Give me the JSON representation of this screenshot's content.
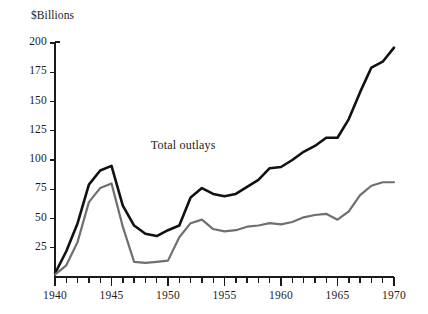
{
  "chart_data": {
    "type": "line",
    "title": "",
    "subtitle": "",
    "xlabel": "",
    "ylabel": "$Billions",
    "unit_label": "$Billions",
    "xlim": [
      1940,
      1970
    ],
    "ylim": [
      0,
      200
    ],
    "grid": false,
    "legend_position": "inline-annotation",
    "x_tick_interval": 1,
    "x_label_interval": 5,
    "y_tick_interval": 25,
    "y_ticks": [
      25,
      50,
      75,
      100,
      125,
      150,
      175,
      200
    ],
    "y_tick_labels": [
      "25",
      "50",
      "75",
      "100",
      "125",
      "150",
      "175",
      "200"
    ],
    "x_ticks": [
      1940,
      1941,
      1942,
      1943,
      1944,
      1945,
      1946,
      1947,
      1948,
      1949,
      1950,
      1951,
      1952,
      1953,
      1954,
      1955,
      1956,
      1957,
      1958,
      1959,
      1960,
      1961,
      1962,
      1963,
      1964,
      1965,
      1966,
      1967,
      1968,
      1969,
      1970
    ],
    "x_tick_labels": [
      "1940",
      "1945",
      "1950",
      "1955",
      "1960",
      "1965",
      "1970"
    ],
    "x_labeled_values": [
      1940,
      1945,
      1950,
      1955,
      1960,
      1965,
      1970
    ],
    "annotations": [
      {
        "text": "Total outlays",
        "x": 1952.2,
        "y": 112,
        "name": "total-outlays-label"
      }
    ],
    "series": [
      {
        "name": "Total outlays",
        "color": "#111111",
        "width": 2.6,
        "x": [
          1940,
          1941,
          1942,
          1943,
          1944,
          1945,
          1946,
          1947,
          1948,
          1949,
          1950,
          1951,
          1952,
          1953,
          1954,
          1955,
          1956,
          1957,
          1958,
          1959,
          1960,
          1961,
          1962,
          1963,
          1964,
          1965,
          1966,
          1967,
          1968,
          1969,
          1970
        ],
        "values": [
          3,
          22,
          46,
          79,
          91,
          95,
          61,
          44,
          37,
          35,
          40,
          44,
          68,
          76,
          71,
          69,
          71,
          77,
          83,
          93,
          94,
          100,
          107,
          112,
          119,
          119,
          135,
          158,
          179,
          184,
          196
        ]
      },
      {
        "name": "Defense outlays",
        "color": "#6f6f6f",
        "width": 2.2,
        "x": [
          1940,
          1941,
          1942,
          1943,
          1944,
          1945,
          1946,
          1947,
          1948,
          1949,
          1950,
          1951,
          1952,
          1953,
          1954,
          1955,
          1956,
          1957,
          1958,
          1959,
          1960,
          1961,
          1962,
          1963,
          1964,
          1965,
          1966,
          1967,
          1968,
          1969,
          1970
        ],
        "values": [
          2,
          10,
          30,
          64,
          76,
          80,
          43,
          13,
          12,
          13,
          14,
          34,
          46,
          49,
          41,
          39,
          40,
          43,
          44,
          46,
          45,
          47,
          51,
          53,
          54,
          49,
          56,
          70,
          78,
          81,
          81
        ]
      }
    ]
  }
}
